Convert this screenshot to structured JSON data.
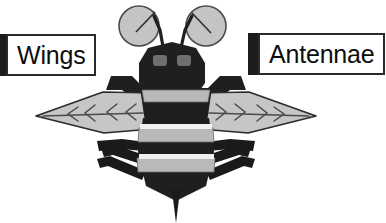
{
  "document": {
    "title": "Bee anatomy labelled diagram",
    "background_color": "#ffffff",
    "width": 386,
    "height": 223,
    "top_cut_off_text": ""
  },
  "callouts": [
    {
      "id": "wings",
      "label": "Wings",
      "marker_color": "#1c1c1c",
      "box_border_color": "#2a2a2a",
      "box_fill": "#ffffff",
      "text_color": "#0d0d0d",
      "points_to": "wing"
    },
    {
      "id": "antennae",
      "label": "Antennae",
      "marker_color": "#1c1c1c",
      "box_border_color": "#2a2a2a",
      "box_fill": "#ffffff",
      "text_color": "#0d0d0d",
      "points_to": "antenna"
    }
  ],
  "colors": {
    "body_dark": "#1f1f1f",
    "stripe_gray": "#b9b9b9",
    "stripe_light": "#f2f2f2",
    "wing_fill": "#c6c6c6",
    "wing_outline": "#2a2a2a",
    "antenna_circle_fill": "#c4c4c4",
    "antenna_circle_stroke": "#4a4a4a",
    "eye_gray": "#6e6e6e",
    "leg_dark": "#1a1a1a",
    "outline": "#1a1a1a"
  },
  "figure": {
    "parts": [
      {
        "name": "antenna-circle-left",
        "shape": "circle",
        "fill": "#c4c4c4"
      },
      {
        "name": "antenna-circle-right",
        "shape": "circle",
        "fill": "#c4c4c4"
      },
      {
        "name": "antenna-stalk-left",
        "shape": "line"
      },
      {
        "name": "antenna-stalk-right",
        "shape": "line"
      },
      {
        "name": "head",
        "shape": "hexagon",
        "fill": "#1f1f1f"
      },
      {
        "name": "eye-left",
        "shape": "rounded-rect",
        "fill": "#6e6e6e"
      },
      {
        "name": "eye-right",
        "shape": "rounded-rect",
        "fill": "#6e6e6e"
      },
      {
        "name": "wing-left",
        "shape": "lens",
        "fill": "#c6c6c6"
      },
      {
        "name": "wing-right",
        "shape": "lens",
        "fill": "#c6c6c6"
      },
      {
        "name": "wing-root-left",
        "shape": "bar",
        "fill": "#1f1f1f"
      },
      {
        "name": "wing-root-right",
        "shape": "bar",
        "fill": "#1f1f1f"
      },
      {
        "name": "thorax",
        "shape": "polygon",
        "fill": "#1f1f1f"
      },
      {
        "name": "abdomen",
        "shape": "polygon",
        "fill": "#1f1f1f"
      },
      {
        "name": "stripe-1",
        "shape": "band",
        "fill": "#b9b9b9"
      },
      {
        "name": "stripe-2",
        "shape": "band",
        "fill": "#b9b9b9"
      },
      {
        "name": "stripe-3",
        "shape": "band",
        "fill": "#b9b9b9"
      },
      {
        "name": "leg-front-left",
        "shape": "bar",
        "fill": "#1a1a1a"
      },
      {
        "name": "leg-front-right",
        "shape": "bar",
        "fill": "#1a1a1a"
      },
      {
        "name": "leg-mid-left",
        "shape": "bar",
        "fill": "#1a1a1a"
      },
      {
        "name": "leg-mid-right",
        "shape": "bar",
        "fill": "#1a1a1a"
      },
      {
        "name": "leg-hind-left",
        "shape": "bar",
        "fill": "#1a1a1a"
      },
      {
        "name": "leg-hind-right",
        "shape": "bar",
        "fill": "#1a1a1a"
      },
      {
        "name": "stinger",
        "shape": "spike",
        "fill": "#1a1a1a"
      }
    ]
  }
}
